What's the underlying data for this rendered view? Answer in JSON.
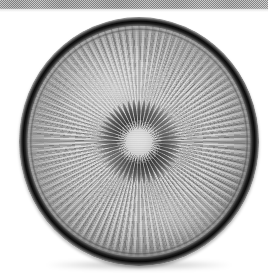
{
  "page": {
    "kind": "scanned-photograph",
    "background_color": "#ffffff",
    "width_px": 275,
    "height_px": 273,
    "caption": ""
  },
  "scan_artifact": {
    "name": "halftone-band",
    "description": "Dithered gray halftone strip along the top edge of the scanned page",
    "color": "#c4c4c4",
    "left_px": 0,
    "top_px": 0,
    "width_px": 268,
    "height_px": 9
  },
  "subject": {
    "name": "pressed-glass-plate",
    "label": "Radially ribbed pressed glass plate",
    "shape": "circular",
    "material": "clear pressed glass",
    "view": "top-down",
    "center_px": {
      "x": 139,
      "y": 141
    },
    "outer_radius_px": 120,
    "palette": {
      "rim_dark": "#0d0d0d",
      "rim_mid": "#3a3a3a",
      "glass_light": "#fdfdfd",
      "glass_mid": "#e4e4e4",
      "glass_shadow": "#a8a8a8",
      "highlight": "#ffffff"
    },
    "rim": {
      "name": "outer-rim",
      "description": "Thick near-black outline ring with a thin lighter bead just inside",
      "thickness_px": 5
    },
    "outer_field": {
      "name": "radial-rib-field",
      "description": "Long tapering radial ribs running from the rim toward the central rosette",
      "rib_count": 100,
      "inner_radius_ratio": 0.2,
      "outer_radius_ratio": 0.93
    },
    "rosette": {
      "name": "central-rosette",
      "description": "Daisy-like rosette of dark teardrop petals around a bright hub",
      "diameter_px": 98,
      "petal_count": 48,
      "petal_color": "#4a4a4a",
      "hub": {
        "name": "rosette-hub",
        "description": "Bright star-burst hub at the exact center",
        "diameter_px": 26,
        "ray_count": 64
      }
    },
    "lighting": {
      "highlight_position": "upper-left",
      "secondary_highlight_position": "lower-right",
      "drop_shadow": true
    }
  }
}
